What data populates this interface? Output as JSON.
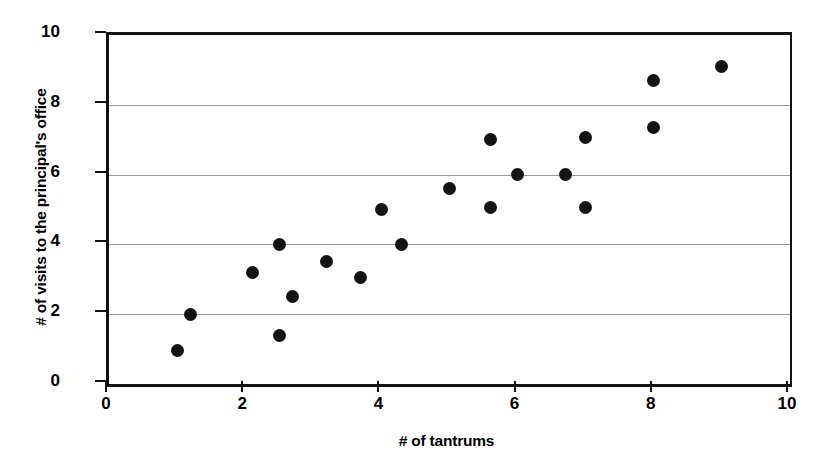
{
  "chart_data": {
    "type": "scatter",
    "title": "",
    "xlabel": "# of tantrums",
    "ylabel": "# of visits to the principal's office",
    "xlim": [
      0,
      10
    ],
    "ylim": [
      0,
      10
    ],
    "xticks": [
      "0",
      "2",
      "4",
      "6",
      "8",
      "10"
    ],
    "xtick_values": [
      0,
      2,
      4,
      6,
      8,
      10
    ],
    "yticks": [
      "0",
      "2",
      "4",
      "6",
      "8",
      "10"
    ],
    "ytick_values": [
      0,
      2,
      4,
      6,
      8,
      10
    ],
    "grid": "horizontal",
    "gridline_values": [
      2,
      4,
      6,
      8
    ],
    "legend": "none",
    "marker_color": "#131313",
    "marker_shape": "circle",
    "axis_color": "#111111",
    "gridline_color": "#9a9a9a",
    "background_color": "#ffffff",
    "point_count": 20,
    "points": [
      {
        "x": 1.0,
        "y": 0.95
      },
      {
        "x": 1.2,
        "y": 2.0
      },
      {
        "x": 2.1,
        "y": 3.2
      },
      {
        "x": 2.5,
        "y": 1.4
      },
      {
        "x": 2.5,
        "y": 4.0
      },
      {
        "x": 2.7,
        "y": 2.5
      },
      {
        "x": 3.2,
        "y": 3.5
      },
      {
        "x": 3.7,
        "y": 3.05
      },
      {
        "x": 4.0,
        "y": 5.0
      },
      {
        "x": 4.3,
        "y": 4.0
      },
      {
        "x": 5.0,
        "y": 5.6
      },
      {
        "x": 5.6,
        "y": 5.05
      },
      {
        "x": 5.6,
        "y": 7.0
      },
      {
        "x": 6.0,
        "y": 6.0
      },
      {
        "x": 6.7,
        "y": 6.0
      },
      {
        "x": 7.0,
        "y": 5.05
      },
      {
        "x": 7.0,
        "y": 7.05
      },
      {
        "x": 8.0,
        "y": 7.35
      },
      {
        "x": 8.0,
        "y": 8.7
      },
      {
        "x": 9.0,
        "y": 9.1
      }
    ]
  }
}
